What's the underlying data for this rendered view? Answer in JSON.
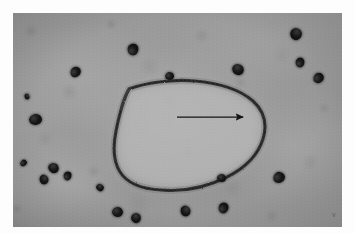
{
  "figure": {
    "kind": "transmission-electron-micrograph",
    "plate_annotation": "v",
    "frame": {
      "canvas_width": 355,
      "canvas_height": 233,
      "plate_left": 13,
      "plate_top": 13,
      "plate_width": 329,
      "plate_height": 214,
      "margin_color": "#fdfdfd"
    },
    "tones": {
      "background_grey": "#a8a8a8",
      "lumen_grey": "#c6c6c6",
      "membrane_dark": "#2e2e2e",
      "particle_black": "#0c0c0c",
      "annotation_black": "#111111"
    }
  },
  "annotations": {
    "arrow": {
      "label": "arrow indicating the bounding membrane",
      "x1": 177,
      "y1": 117,
      "x2": 243,
      "y2": 117,
      "color": "#141414",
      "head": "solid-triangle",
      "direction": "right"
    }
  },
  "organelle": {
    "name": "vesicle-outline",
    "shape": "D-shaped / kidney-shaped closed profile",
    "membrane_thickness_px": 3,
    "has_tail_projection": true,
    "outline_path": "M 116 76 C 132 70 158 66 182 68 C 206 70 226 76 240 88 C 252 99 254 113 250 126 C 245 142 232 155 214 164 C 194 174 170 179 148 177 C 128 176 114 170 107 159 C 100 148 100 133 103 118 C 106 103 110 87 116 76 Z",
    "tail_path": "M 117 75 C 113 79 110 86 108 94"
  },
  "particles": [
    {
      "id": "p01",
      "x": 127,
      "y": 44,
      "w": 12,
      "h": 11
    },
    {
      "id": "p02",
      "x": 70,
      "y": 67,
      "w": 11,
      "h": 10
    },
    {
      "id": "p03",
      "x": 165,
      "y": 72,
      "w": 9,
      "h": 8
    },
    {
      "id": "p04",
      "x": 232,
      "y": 64,
      "w": 12,
      "h": 11
    },
    {
      "id": "p05",
      "x": 290,
      "y": 28,
      "w": 12,
      "h": 12
    },
    {
      "id": "p06",
      "x": 295,
      "y": 58,
      "w": 10,
      "h": 9
    },
    {
      "id": "p07",
      "x": 313,
      "y": 73,
      "w": 11,
      "h": 10
    },
    {
      "id": "p08",
      "x": 29,
      "y": 114,
      "w": 13,
      "h": 11
    },
    {
      "id": "p09",
      "x": 48,
      "y": 163,
      "w": 11,
      "h": 10
    },
    {
      "id": "p10",
      "x": 39,
      "y": 175,
      "w": 10,
      "h": 9
    },
    {
      "id": "p11",
      "x": 63,
      "y": 172,
      "w": 9,
      "h": 8
    },
    {
      "id": "p12",
      "x": 20,
      "y": 160,
      "w": 7,
      "h": 6
    },
    {
      "id": "p13",
      "x": 112,
      "y": 207,
      "w": 11,
      "h": 10
    },
    {
      "id": "p14",
      "x": 131,
      "y": 213,
      "w": 10,
      "h": 10
    },
    {
      "id": "p15",
      "x": 180,
      "y": 206,
      "w": 11,
      "h": 10
    },
    {
      "id": "p16",
      "x": 218,
      "y": 203,
      "w": 11,
      "h": 10
    },
    {
      "id": "p17",
      "x": 273,
      "y": 172,
      "w": 12,
      "h": 11
    },
    {
      "id": "p18",
      "x": 217,
      "y": 174,
      "w": 9,
      "h": 8
    },
    {
      "id": "p19",
      "x": 96,
      "y": 184,
      "w": 8,
      "h": 7
    },
    {
      "id": "p20",
      "x": 24,
      "y": 94,
      "w": 6,
      "h": 5
    }
  ]
}
